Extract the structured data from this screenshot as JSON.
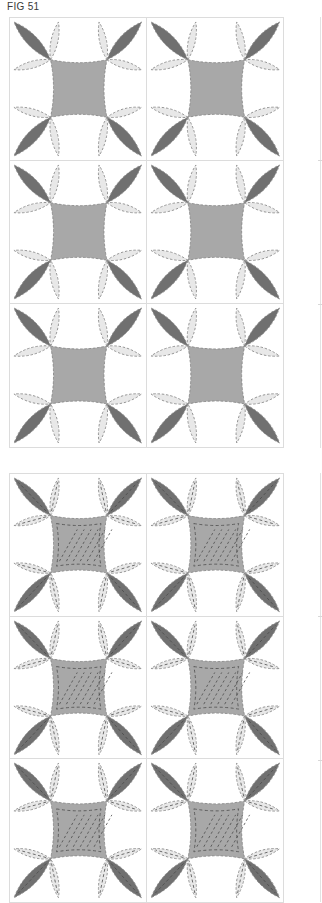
{
  "figure": {
    "title": "FIG 51",
    "colors": {
      "background": "#ffffff",
      "grid_line": "#dcdcdc",
      "center_fill": "#a8a8a8",
      "dark_petal": "#707070",
      "light_petal": "#e8e8e8",
      "stitch": "#8a8a8a",
      "quilting_stitch": "#4a4a4a"
    }
  },
  "panels": [
    {
      "name": "appliqued-blocks",
      "rows": 3,
      "columns": 2,
      "quilted": false,
      "blocks": [
        "block-1",
        "block-2",
        "block-3",
        "block-4",
        "block-5",
        "block-6"
      ]
    },
    {
      "name": "quilted-blocks",
      "rows": 3,
      "columns": 2,
      "quilted": true,
      "blocks": [
        "block-1",
        "block-2",
        "block-3",
        "block-4",
        "block-5",
        "block-6"
      ]
    }
  ]
}
